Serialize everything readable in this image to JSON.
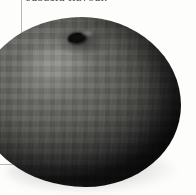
{
  "page": {
    "background_color": "#fdfdfc",
    "caption_text": "subacid flavour.",
    "rule_color": "#b9b9b9"
  },
  "rules": {
    "vertical_name": "vertical-rule",
    "horizontal_name": "horizontal-rule"
  },
  "figure": {
    "alt_text": "subacid flavour.",
    "stem_label": "stem",
    "shadow_label": "cast-shadow",
    "skin_dark_color": "#303030",
    "skin_mid_color": "#5a5a56",
    "skin_light_color": "#787874",
    "stem_color": "#111111"
  }
}
